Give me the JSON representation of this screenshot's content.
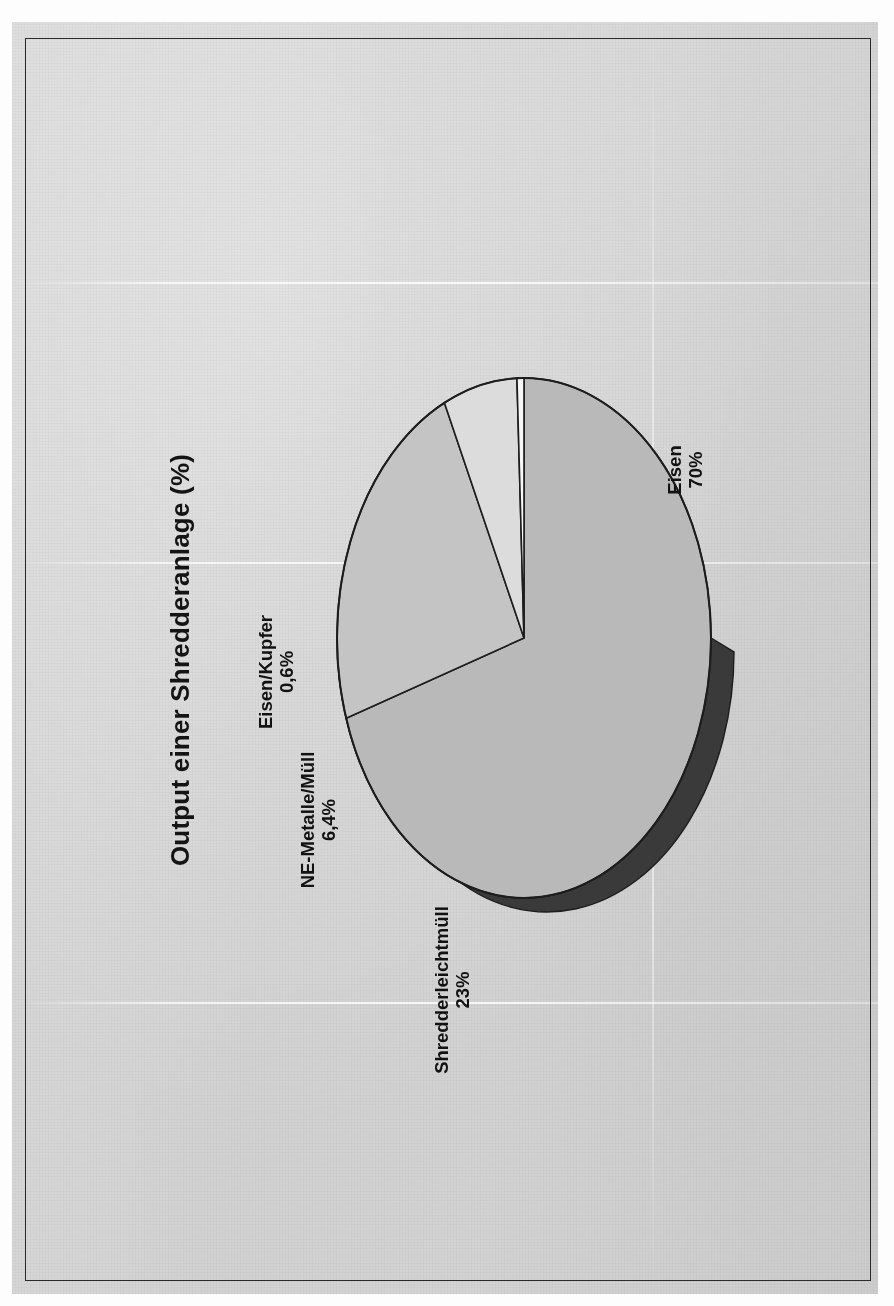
{
  "document": {
    "kind": "scanned-page",
    "background_color": "#d5d5d5",
    "frame_color": "#2a2a2a"
  },
  "chart_data": {
    "type": "pie",
    "title": "Output einer Shredderanlage (%)",
    "xlabel": "",
    "ylabel": "",
    "unit": "%",
    "decimal_separator": ",",
    "three_d": true,
    "rotation_deg": -90,
    "legend_position": "none",
    "grid": false,
    "categories": [
      "Eisen",
      "Shredderleichtmüll",
      "NE-Metalle/Müll",
      "Eisen/Kupfer"
    ],
    "values": [
      70,
      23,
      6.4,
      0.6
    ],
    "value_labels": [
      "70%",
      "23%",
      "6,4%",
      "0,6%"
    ],
    "slice_colors": [
      "#b9b9b9",
      "#c4c4c4",
      "#dcdcdc",
      "#f7f7f7"
    ],
    "depth_wall_color": "#3a3a3a",
    "outline_color": "#1d1d1d",
    "slices": [
      {
        "name": "Eisen",
        "value": 70,
        "value_label": "70%",
        "label_line1": "Eisen",
        "label_line2": "70%",
        "fill": "#b9b9b9"
      },
      {
        "name": "Shredderleichtmüll",
        "value": 23,
        "value_label": "23%",
        "label_line1": "Shredderleichtmüll",
        "label_line2": "23%",
        "fill": "#c4c4c4"
      },
      {
        "name": "NE-Metalle/Müll",
        "value": 6.4,
        "value_label": "6,4%",
        "label_line1": "NE-Metalle/Müll",
        "label_line2": "6,4%",
        "fill": "#dcdcdc"
      },
      {
        "name": "Eisen/Kupfer",
        "value": 0.6,
        "value_label": "0,6%",
        "label_line1": "Eisen/Kupfer",
        "label_line2": "0,6%",
        "fill": "#f7f7f7"
      }
    ]
  },
  "labels": {
    "eisen": {
      "line1": "Eisen",
      "line2": "70%"
    },
    "shredder": {
      "line1": "Shredderleichtmüll",
      "line2": "23%"
    },
    "ne_metalle": {
      "line1": "NE-Metalle/Müll",
      "line2": "6,4%"
    },
    "eisen_kupfer": {
      "line1": "Eisen/Kupfer",
      "line2": "0,6%"
    }
  }
}
